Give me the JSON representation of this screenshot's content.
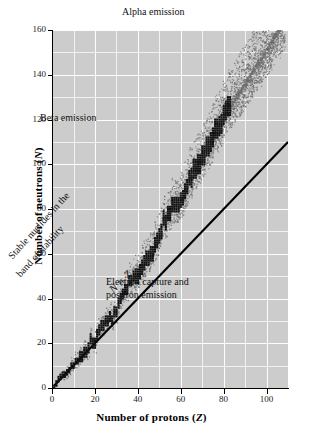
{
  "chart_data": {
    "type": "scatter",
    "title": "",
    "xlabel": "Number of protons (Z)",
    "xlabel_italic_symbol": "Z",
    "ylabel": "Number of neutrons (N)",
    "ylabel_italic_symbol": "N",
    "xlim": [
      0,
      110
    ],
    "ylim": [
      0,
      160
    ],
    "xticks": [
      0,
      20,
      40,
      60,
      80,
      100
    ],
    "yticks": [
      0,
      20,
      40,
      60,
      80,
      100,
      120,
      140,
      160
    ],
    "xtick_labels": [
      "0",
      "20",
      "40",
      "60",
      "80",
      "100"
    ],
    "ytick_labels": [
      "0",
      "20",
      "40",
      "60",
      "80",
      "100",
      "120",
      "140",
      "160"
    ],
    "grid": true,
    "grid_minor_step_x": 10,
    "grid_minor_step_y": 10,
    "legend": "none",
    "plot_background": "#cccccc",
    "grid_color": "#f5f5f5",
    "series": [
      {
        "name": "N = Z reference line",
        "type": "line",
        "color": "#000000",
        "points": [
          [
            1,
            1
          ],
          [
            110,
            110
          ]
        ]
      },
      {
        "name": "Stable nuclides (band of stability)",
        "type": "staircase",
        "color": "#111111",
        "points": [
          [
            1,
            0
          ],
          [
            2,
            2
          ],
          [
            3,
            4
          ],
          [
            4,
            5
          ],
          [
            5,
            6
          ],
          [
            6,
            6
          ],
          [
            7,
            7
          ],
          [
            8,
            8
          ],
          [
            9,
            10
          ],
          [
            10,
            10
          ],
          [
            11,
            12
          ],
          [
            12,
            12
          ],
          [
            13,
            14
          ],
          [
            14,
            14
          ],
          [
            15,
            16
          ],
          [
            16,
            16
          ],
          [
            17,
            18
          ],
          [
            18,
            22
          ],
          [
            19,
            20
          ],
          [
            20,
            20
          ],
          [
            21,
            24
          ],
          [
            22,
            26
          ],
          [
            23,
            28
          ],
          [
            24,
            28
          ],
          [
            25,
            30
          ],
          [
            26,
            30
          ],
          [
            27,
            32
          ],
          [
            28,
            30
          ],
          [
            29,
            34
          ],
          [
            30,
            34
          ],
          [
            31,
            38
          ],
          [
            32,
            40
          ],
          [
            33,
            42
          ],
          [
            34,
            44
          ],
          [
            35,
            44
          ],
          [
            36,
            48
          ],
          [
            37,
            48
          ],
          [
            38,
            50
          ],
          [
            39,
            50
          ],
          [
            40,
            50
          ],
          [
            41,
            52
          ],
          [
            42,
            54
          ],
          [
            43,
            56
          ],
          [
            44,
            58
          ],
          [
            45,
            58
          ],
          [
            46,
            60
          ],
          [
            47,
            60
          ],
          [
            48,
            64
          ],
          [
            49,
            66
          ],
          [
            50,
            68
          ],
          [
            51,
            70
          ],
          [
            52,
            76
          ],
          [
            53,
            74
          ],
          [
            54,
            78
          ],
          [
            55,
            78
          ],
          [
            56,
            82
          ],
          [
            57,
            82
          ],
          [
            58,
            82
          ],
          [
            59,
            82
          ],
          [
            60,
            84
          ],
          [
            61,
            85
          ],
          [
            62,
            88
          ],
          [
            63,
            90
          ],
          [
            64,
            94
          ],
          [
            65,
            94
          ],
          [
            66,
            98
          ],
          [
            67,
            98
          ],
          [
            68,
            100
          ],
          [
            69,
            100
          ],
          [
            70,
            104
          ],
          [
            71,
            104
          ],
          [
            72,
            108
          ],
          [
            73,
            108
          ],
          [
            74,
            110
          ],
          [
            75,
            112
          ],
          [
            76,
            116
          ],
          [
            77,
            116
          ],
          [
            78,
            117
          ],
          [
            79,
            118
          ],
          [
            80,
            122
          ],
          [
            81,
            124
          ],
          [
            82,
            126
          ],
          [
            83,
            126
          ]
        ]
      },
      {
        "name": "Unstable nuclides (stipple cloud)",
        "type": "stipple",
        "color": "#6b6b6b",
        "description": "Dotted cloud of radioactive nuclides flanking the band of stability, widening toward high Z and extending to about Z=106, N=158"
      }
    ],
    "annotations": [
      {
        "id": "alpha-emission",
        "text": "Alpha emission",
        "x": 72,
        "y": 152,
        "rotation": 0
      },
      {
        "id": "beta-emission",
        "text": "Beta emission",
        "x": 24,
        "y": 105,
        "rotation": 0
      },
      {
        "id": "electron-capture",
        "text": "Electron capture and",
        "x": 62,
        "y": 37,
        "rotation": 0
      },
      {
        "id": "positron-emission",
        "text": "positron emission",
        "x": 62,
        "y": 32,
        "rotation": 0
      },
      {
        "id": "band-line-1",
        "text": "Stable nuclides in the",
        "x": 16,
        "y": 62,
        "rotation": -48
      },
      {
        "id": "band-line-2",
        "text": "band of stability",
        "x": 19,
        "y": 55,
        "rotation": -48
      },
      {
        "id": "n-equals-z",
        "text": "N = Z",
        "x": 56,
        "y": 49,
        "rotation": -45,
        "italic": true
      }
    ]
  },
  "chart": {
    "xlabel_prefix": "Number of protons (",
    "xlabel_symbol": "Z",
    "xlabel_suffix": ")",
    "ylabel_prefix": "Number of neutrons (",
    "ylabel_symbol": "N",
    "ylabel_suffix": ")"
  },
  "annotations": {
    "alpha": "Alpha emission",
    "beta": "Beta emission",
    "ec_line1": "Electron capture and",
    "ec_line2": "positron emission",
    "band_line1": "Stable nuclides in the",
    "band_line2": "band of stability",
    "nz": "N = Z"
  }
}
